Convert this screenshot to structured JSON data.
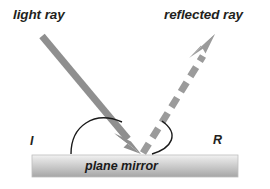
{
  "figure": {
    "type": "physics-diagram",
    "background_color": "#ffffff"
  },
  "labels": {
    "light_ray": "light ray",
    "reflected_ray": "reflected ray",
    "incident_point": "I",
    "reflection_point": "R",
    "mirror": "plane mirror"
  },
  "colors": {
    "ray": "#8c8c8c",
    "ray_dashed": "#9a9a9a",
    "arc": "#1a1a1a",
    "text": "#231f20",
    "mirror_top": "#efefef",
    "mirror_bottom": "#a9a9a9",
    "mirror_border": "#b5b5b5"
  },
  "geometry": {
    "incident_ray": {
      "start": [
        42,
        36
      ],
      "end": [
        141,
        154
      ],
      "style": "solid",
      "arrow": "end",
      "width": 7
    },
    "reflected_ray": {
      "start": [
        141,
        154
      ],
      "end": [
        215,
        34
      ],
      "style": "dashed",
      "arrow": "end",
      "width": 7,
      "dash_pattern": "11 7"
    },
    "mirror_bar": {
      "x": 32,
      "y": 155,
      "width": 206,
      "height": 22
    },
    "angle_arc_incident": {
      "from": [
        70,
        154
      ],
      "to": [
        123,
        123
      ],
      "label": "I"
    },
    "angle_arc_reflected": {
      "from": [
        163,
        123
      ],
      "to": [
        150,
        154
      ],
      "label": "R"
    }
  }
}
